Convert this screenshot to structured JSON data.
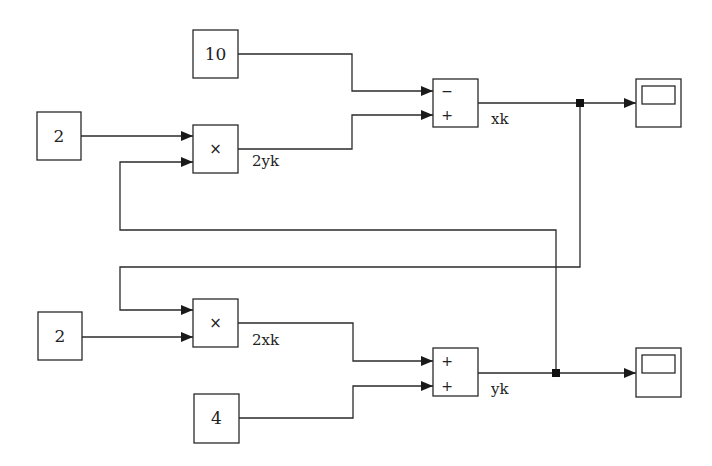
{
  "diagram": {
    "type": "simulink-block-diagram",
    "blocks": {
      "const_10": {
        "label": "10"
      },
      "const_2_top": {
        "label": "2"
      },
      "const_2_bottom": {
        "label": "2"
      },
      "const_4": {
        "label": "4"
      },
      "product_top": {
        "op": "×"
      },
      "product_bottom": {
        "op": "×"
      },
      "sum_top": {
        "signs": [
          "−",
          "+"
        ]
      },
      "sum_bottom": {
        "signs": [
          "+",
          "+"
        ]
      },
      "scope_top": {
        "icon": "scope-icon"
      },
      "scope_bottom": {
        "icon": "scope-icon"
      }
    },
    "signals": {
      "two_yk": "2yk",
      "two_xk": "2xk",
      "xk": "xk",
      "yk": "yk"
    },
    "colors": {
      "line": "#2a2a2a",
      "background": "#ffffff"
    }
  }
}
